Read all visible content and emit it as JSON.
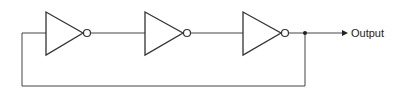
{
  "diagram": {
    "type": "ring-oscillator",
    "gates": [
      {
        "kind": "inverter",
        "index": 1
      },
      {
        "kind": "inverter",
        "index": 2
      },
      {
        "kind": "inverter",
        "index": 3
      }
    ],
    "output_label": "Output",
    "feedback": "output of inverter 3 fed back to input of inverter 1"
  }
}
